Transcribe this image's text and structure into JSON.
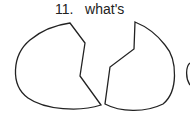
{
  "question": {
    "number": "11.",
    "text": "what's"
  },
  "figure": {
    "stroke_color": "#222222"
  }
}
